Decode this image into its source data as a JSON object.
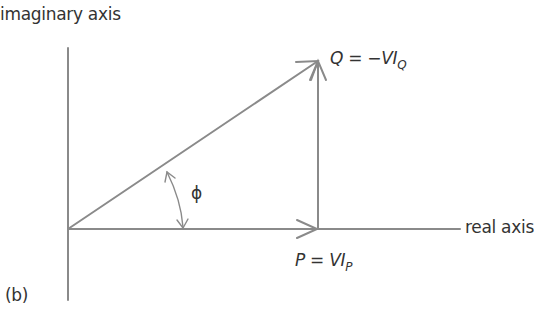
{
  "diagram": {
    "panel_label": "(b)",
    "axes": {
      "vertical_label": "imaginary axis",
      "horizontal_label": "real axis"
    },
    "vectors": {
      "apparent_power": {
        "description": "hypotenuse from origin to tip"
      },
      "reactive": {
        "symbol": "Q",
        "equals": "=",
        "expr_main": "−VI",
        "expr_sub": "Q"
      },
      "real": {
        "symbol": "P",
        "equals": "=",
        "expr_main": "VI",
        "expr_sub": "P"
      }
    },
    "angle": {
      "symbol": "ϕ"
    },
    "colors": {
      "line": "#8a8a8a",
      "text": "#333333",
      "background": "#ffffff"
    }
  }
}
